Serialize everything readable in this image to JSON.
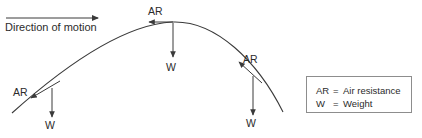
{
  "diagram": {
    "title_caption": "Direction of motion",
    "stroke_color": "#3a3a3a",
    "text_color": "#2b2b2b",
    "background_color": "#ffffff",
    "motion_arrow": {
      "label": "Direction of motion",
      "x1": 6,
      "y1": 18,
      "x2": 100,
      "y2": 18,
      "direction": "right"
    },
    "trajectory": {
      "description": "projectile parabolic path",
      "start": [
        12,
        113
      ],
      "apex": [
        172,
        22
      ],
      "end": [
        283,
        112
      ]
    },
    "force_points": [
      {
        "id": "ascending",
        "origin": [
          52,
          88
        ],
        "air_resistance": {
          "label": "AR",
          "tip": [
            30,
            99
          ],
          "label_pos": [
            13,
            87
          ]
        },
        "weight": {
          "label": "W",
          "tip": [
            52,
            119
          ],
          "label_pos": [
            45,
            120
          ]
        }
      },
      {
        "id": "apex",
        "origin": [
          172,
          22
        ],
        "air_resistance": {
          "label": "AR",
          "tip": [
            148,
            22
          ],
          "label_pos": [
            148,
            6
          ]
        },
        "weight": {
          "label": "W",
          "tip": [
            172,
            59
          ],
          "label_pos": [
            166,
            62
          ]
        }
      },
      {
        "id": "descending",
        "origin": [
          253,
          75
        ],
        "air_resistance": {
          "label": "AR",
          "tip": [
            238,
            61
          ],
          "label_pos": [
            243,
            54
          ]
        },
        "weight": {
          "label": "W",
          "tip": [
            253,
            117
          ],
          "label_pos": [
            246,
            118
          ]
        }
      }
    ],
    "legend": {
      "border_color": "#8d8d8d",
      "entries": [
        {
          "key": "AR",
          "eq": "=",
          "meaning": "Air resistance"
        },
        {
          "key": "W",
          "eq": "=",
          "meaning": "Weight"
        }
      ]
    }
  }
}
